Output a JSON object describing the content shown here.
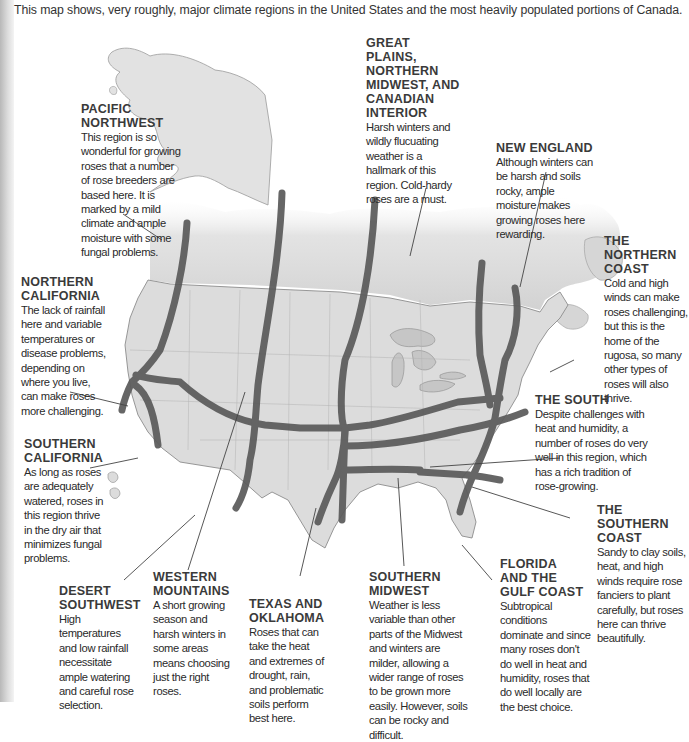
{
  "intro": "This map shows, very roughly, major climate regions in the United States and the most heavily populated portions of Canada.",
  "colors": {
    "background": "#ffffff",
    "land": "#dedede",
    "land_dark": "#cfcfcf",
    "water": "#c8c8c8",
    "band": "#5a5a5a",
    "text": "#2b2b2b",
    "title": "#3a3a3a",
    "leader_line": "#444444"
  },
  "regions": [
    {
      "id": "pacific-northwest",
      "title_line1": "Pacific",
      "title_line2": "Northwest",
      "title_line3": "",
      "title_line4": "",
      "title_line5": "",
      "desc": "This region is so wonderful for growing roses that a number of rose breeders are based here. It is marked by a mild climate and ample moisture with some fungal problems."
    },
    {
      "id": "great-plains",
      "title_line1": "Great Plains,",
      "title_line2": "Northern",
      "title_line3": "Midwest, and",
      "title_line4": "Canadian",
      "title_line5": "Interior",
      "desc": "Harsh winters and wildly flucuating weather is a hallmark of this region. Cold-hardy roses are a must."
    },
    {
      "id": "new-england",
      "title_line1": "New England",
      "title_line2": "",
      "title_line3": "",
      "title_line4": "",
      "title_line5": "",
      "desc": "Although winters can be harsh and soils rocky, ample moisture makes growing roses here rewarding."
    },
    {
      "id": "northern-coast",
      "title_line1": "The",
      "title_line2": "Northern",
      "title_line3": "Coast",
      "title_line4": "",
      "title_line5": "",
      "desc": "Cold and high winds can make roses challenging, but this is the home of the rugosa, so many other types of roses will also thrive."
    },
    {
      "id": "northern-california",
      "title_line1": "Northern",
      "title_line2": "California",
      "title_line3": "",
      "title_line4": "",
      "title_line5": "",
      "desc": "The lack of rainfall here and variable temperatures or disease problems, depending on where you live, can make roses more challenging."
    },
    {
      "id": "the-south",
      "title_line1": "The South",
      "title_line2": "",
      "title_line3": "",
      "title_line4": "",
      "title_line5": "",
      "desc": "Despite challenges with heat and humidity, a number of roses do very well in this region, which has a rich tradition of rose-growing."
    },
    {
      "id": "southern-california",
      "title_line1": "Southern",
      "title_line2": "California",
      "title_line3": "",
      "title_line4": "",
      "title_line5": "",
      "desc": "As long as roses are adequately watered, roses in this region thrive in the dry air that minimizes fungal problems."
    },
    {
      "id": "southern-coast",
      "title_line1": "The Southern",
      "title_line2": "Coast",
      "title_line3": "",
      "title_line4": "",
      "title_line5": "",
      "desc": "Sandy to clay soils, heat, and high winds require rose fanciers to plant carefully, but roses here can thrive beautifully."
    },
    {
      "id": "desert-southwest",
      "title_line1": "Desert",
      "title_line2": "Southwest",
      "title_line3": "",
      "title_line4": "",
      "title_line5": "",
      "desc": "High temperatures and low rainfall necessitate ample watering and careful rose selection."
    },
    {
      "id": "western-mountains",
      "title_line1": "Western",
      "title_line2": "Mountains",
      "title_line3": "",
      "title_line4": "",
      "title_line5": "",
      "desc": "A short growing season and harsh winters in some areas means choosing just the right roses."
    },
    {
      "id": "texas-oklahoma",
      "title_line1": "Texas and",
      "title_line2": "Oklahoma",
      "title_line3": "",
      "title_line4": "",
      "title_line5": "",
      "desc": "Roses that can take the heat and extremes of drought, rain, and problematic soils perform best here."
    },
    {
      "id": "southern-midwest",
      "title_line1": "Southern",
      "title_line2": "Midwest",
      "title_line3": "",
      "title_line4": "",
      "title_line5": "",
      "desc": "Weather is less variable than other parts of the Midwest and winters are milder, allowing a wider range of roses to be grown more easily. However, soils can be rocky and difficult."
    },
    {
      "id": "florida-gulf",
      "title_line1": "Florida",
      "title_line2": "and the",
      "title_line3": "Gulf Coast",
      "title_line4": "",
      "title_line5": "",
      "desc": "Subtropical conditions dominate and since many roses don't do well in heat and humidity, roses that do well locally are the best choice."
    }
  ]
}
